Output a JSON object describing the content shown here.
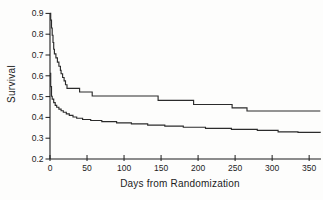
{
  "figure": {
    "background": "#fdfdfc",
    "axis_color": "#1c1c1c",
    "curve_color": "#2b2b2b"
  },
  "chart_data": {
    "type": "line",
    "subtype": "step-survival-kaplan-meier",
    "title": "",
    "xlabel": "Days from Randomization",
    "ylabel": "Survival",
    "xlim": [
      0,
      366
    ],
    "ylim": [
      0.2,
      0.9
    ],
    "x_ticks": [
      0,
      50,
      100,
      150,
      200,
      250,
      300,
      350
    ],
    "y_ticks": [
      0.9,
      0.8,
      0.7,
      0.6,
      0.5,
      0.4,
      0.3,
      0.2
    ],
    "grid": false,
    "legend": false,
    "series": [
      {
        "name": "upper",
        "points": [
          [
            0,
            0.9
          ],
          [
            1,
            0.868
          ],
          [
            2,
            0.83
          ],
          [
            3,
            0.795
          ],
          [
            4,
            0.76
          ],
          [
            5,
            0.728
          ],
          [
            6,
            0.706
          ],
          [
            8,
            0.686
          ],
          [
            10,
            0.666
          ],
          [
            12,
            0.646
          ],
          [
            14,
            0.626
          ],
          [
            15,
            0.61
          ],
          [
            17,
            0.592
          ],
          [
            19,
            0.576
          ],
          [
            21,
            0.557
          ],
          [
            23,
            0.54
          ],
          [
            40,
            0.522
          ],
          [
            57,
            0.503
          ],
          [
            146,
            0.482
          ],
          [
            194,
            0.462
          ],
          [
            246,
            0.446
          ],
          [
            266,
            0.431
          ],
          [
            365,
            0.431
          ]
        ]
      },
      {
        "name": "lower",
        "points": [
          [
            0,
            0.612
          ],
          [
            1,
            0.548
          ],
          [
            2,
            0.502
          ],
          [
            3,
            0.488
          ],
          [
            5,
            0.471
          ],
          [
            7,
            0.458
          ],
          [
            9,
            0.449
          ],
          [
            12,
            0.44
          ],
          [
            15,
            0.432
          ],
          [
            18,
            0.425
          ],
          [
            22,
            0.417
          ],
          [
            26,
            0.41
          ],
          [
            31,
            0.402
          ],
          [
            36,
            0.396
          ],
          [
            44,
            0.39
          ],
          [
            55,
            0.385
          ],
          [
            70,
            0.38
          ],
          [
            90,
            0.374
          ],
          [
            110,
            0.369
          ],
          [
            132,
            0.363
          ],
          [
            155,
            0.358
          ],
          [
            180,
            0.353
          ],
          [
            210,
            0.347
          ],
          [
            245,
            0.343
          ],
          [
            280,
            0.338
          ],
          [
            308,
            0.331
          ],
          [
            335,
            0.328
          ],
          [
            365,
            0.326
          ]
        ]
      }
    ]
  }
}
